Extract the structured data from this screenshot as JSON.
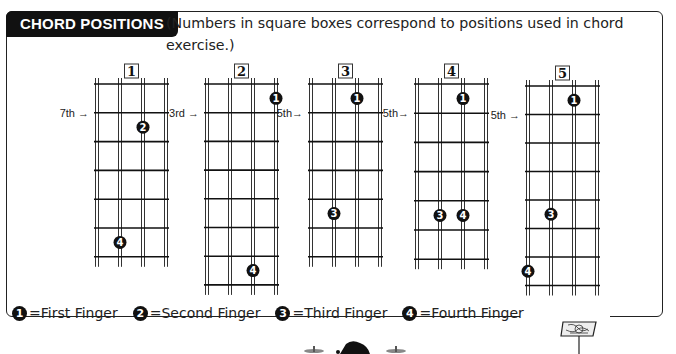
{
  "header": {
    "title": "CHORD POSITIONS",
    "subtitle": "(Numbers in square boxes correspond to positions used in chord exercise.)"
  },
  "diagrams": [
    {
      "label": "1",
      "position_marker": "7th →",
      "marker_fret_line": 1,
      "frets": 6,
      "fingers": [
        {
          "finger": "2",
          "string": 3,
          "fret": 2
        },
        {
          "finger": "4",
          "string": 2,
          "fret": 6
        }
      ]
    },
    {
      "label": "2",
      "position_marker": "3rd →",
      "marker_fret_line": 1,
      "frets": 7,
      "fingers": [
        {
          "finger": "1",
          "string": 4,
          "fret": 1
        },
        {
          "finger": "4",
          "string": 3,
          "fret": 7
        }
      ]
    },
    {
      "label": "3",
      "position_marker": "5th→",
      "marker_fret_line": 1,
      "frets": 6,
      "fingers": [
        {
          "finger": "1",
          "string": 3,
          "fret": 1
        },
        {
          "finger": "3",
          "string": 2,
          "fret": 5
        }
      ]
    },
    {
      "label": "4",
      "position_marker": "5th→",
      "marker_fret_line": 1,
      "frets": 6,
      "fingers": [
        {
          "finger": "1",
          "string": 3,
          "fret": 1
        },
        {
          "finger": "3",
          "string": 2,
          "fret": 5
        },
        {
          "finger": "4",
          "string": 3,
          "fret": 5
        }
      ]
    },
    {
      "label": "5",
      "position_marker": "5th →",
      "marker_fret_line": 1,
      "frets": 7,
      "fingers": [
        {
          "finger": "1",
          "string": 3,
          "fret": 1
        },
        {
          "finger": "3",
          "string": 2,
          "fret": 5
        },
        {
          "finger": "4",
          "string": 1,
          "fret": 7
        }
      ]
    }
  ],
  "legend": [
    {
      "symbol": "1",
      "text": "=First Finger"
    },
    {
      "symbol": "2",
      "text": "=Second Finger"
    },
    {
      "symbol": "3",
      "text": "=Third Finger"
    },
    {
      "symbol": "4",
      "text": "=Fourth Finger"
    }
  ],
  "icons": {
    "music_stand": "music-stand-icon",
    "ornament": "drum-kit-icon"
  }
}
